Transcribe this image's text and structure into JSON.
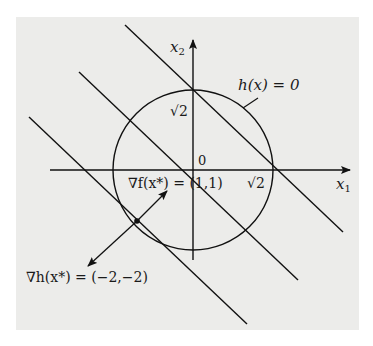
{
  "figure": {
    "title": "",
    "axes": {
      "x_label": "x",
      "x_sub": "1",
      "y_label": "x",
      "y_sub": "2",
      "origin_label": "0"
    },
    "constraint": {
      "label": "h(x) = 0",
      "type": "circle",
      "radius_label": "√2"
    },
    "tick_labels": {
      "x_axis": "√2",
      "y_axis": "√2"
    },
    "level_lines": {
      "description": "level sets of f(x) = x1 + x2",
      "count": 3
    },
    "optimum": {
      "point": "x*",
      "grad_f_label": "∇f(x*) = (1,1)",
      "grad_h_label": "∇h(x*) = (−2,−2)"
    }
  },
  "colors": {
    "background": "#ffffff",
    "panel": "#ececea",
    "stroke": "#111111"
  }
}
